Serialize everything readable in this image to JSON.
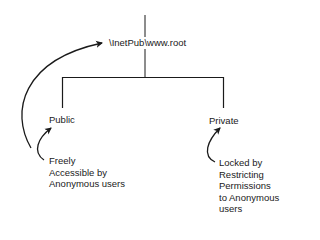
{
  "diagram": {
    "type": "directory-tree",
    "root": {
      "label": "\\InetPub\\www.root"
    },
    "children": [
      {
        "label": "Public",
        "annotation_lines": [
          "Freely",
          "Accessible by",
          "Anonymous users"
        ]
      },
      {
        "label": "Private",
        "annotation_lines": [
          "Locked by",
          "Restricting",
          "Permissions",
          "to Anonymous",
          "users"
        ]
      }
    ],
    "colors": {
      "line": "#1a1a1a",
      "background": "#ffffff"
    }
  }
}
